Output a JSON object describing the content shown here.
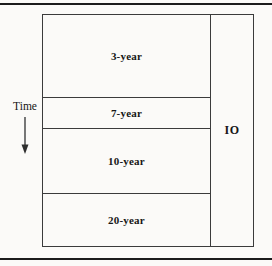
{
  "figure": {
    "background": "#fbfaf8",
    "rule_color": "#1c1c1c",
    "line_color": "#3b3b3b",
    "text_color": "#161616"
  },
  "diagram": {
    "time_label": "Time",
    "io_label": "IO",
    "tranches": [
      {
        "label": "3-year"
      },
      {
        "label": "7-year"
      },
      {
        "label": "10-year"
      },
      {
        "label": "20-year"
      }
    ]
  }
}
